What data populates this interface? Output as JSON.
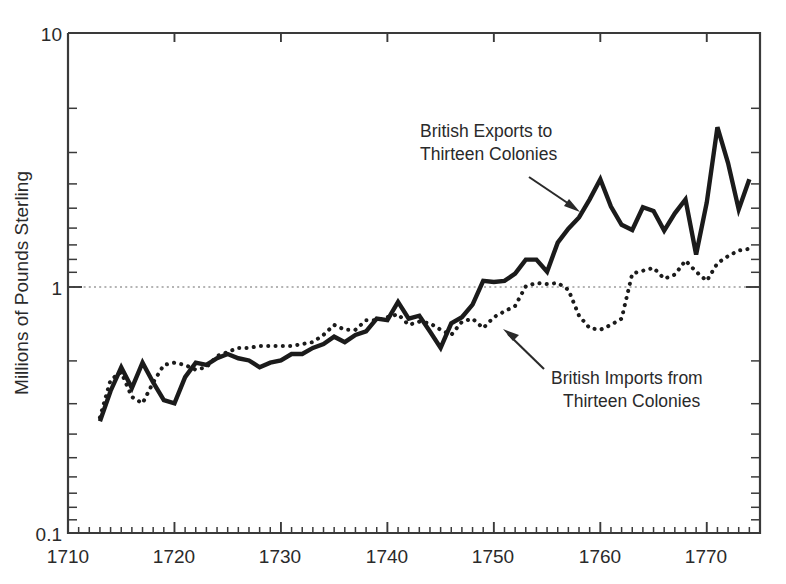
{
  "chart_data": {
    "type": "line",
    "title": "",
    "subtitle": "",
    "xlabel": "",
    "ylabel": "Millions of Pounds Sterling",
    "yscale": "log",
    "xlim": [
      1710,
      1775
    ],
    "ylim": [
      0.1,
      10
    ],
    "grid": "single dotted horizontal gridline at y = 1",
    "legend_position": "inline annotations with arrows",
    "x_tick_labels": [
      "1710",
      "1720",
      "1730",
      "1740",
      "1750",
      "1760",
      "1770"
    ],
    "x_major_ticks": [
      1710,
      1720,
      1730,
      1740,
      1750,
      1760,
      1770
    ],
    "x_minor_tick_interval": 1,
    "y_tick_labels": [
      "10",
      "1",
      "0.1"
    ],
    "y_major_ticks": [
      10,
      1,
      0.1
    ],
    "y_minor_ticks": [
      0.2,
      0.3,
      0.4,
      0.5,
      0.6,
      0.7,
      0.8,
      0.9,
      2,
      3,
      4,
      5,
      6,
      7,
      8,
      9
    ],
    "annotations": [
      {
        "text_line1": "British Exports to",
        "text_line2": "Thirteen Colonies",
        "points_to_year": 1758,
        "points_to_value": 1.75
      },
      {
        "text_line1": "British Imports from",
        "text_line2": "Thirteen Colonies",
        "points_to_year": 1752,
        "points_to_value": 0.73
      }
    ],
    "x": [
      1713,
      1714,
      1715,
      1716,
      1717,
      1718,
      1719,
      1720,
      1721,
      1722,
      1723,
      1724,
      1725,
      1726,
      1727,
      1728,
      1729,
      1730,
      1731,
      1732,
      1733,
      1734,
      1735,
      1736,
      1737,
      1738,
      1739,
      1740,
      1741,
      1742,
      1743,
      1744,
      1745,
      1746,
      1747,
      1748,
      1749,
      1750,
      1751,
      1752,
      1753,
      1754,
      1755,
      1756,
      1757,
      1758,
      1759,
      1760,
      1761,
      1762,
      1763,
      1764,
      1765,
      1766,
      1767,
      1768,
      1769,
      1770,
      1771,
      1772,
      1773,
      1774
    ],
    "series": [
      {
        "name": "British Exports to Thirteen Colonies",
        "style": "solid",
        "color": "#1b1b1b",
        "values": [
          0.28,
          0.37,
          0.46,
          0.38,
          0.48,
          0.4,
          0.34,
          0.33,
          0.42,
          0.48,
          0.47,
          0.5,
          0.52,
          0.5,
          0.49,
          0.46,
          0.48,
          0.49,
          0.52,
          0.52,
          0.55,
          0.57,
          0.61,
          0.58,
          0.62,
          0.64,
          0.72,
          0.71,
          0.84,
          0.72,
          0.74,
          0.64,
          0.55,
          0.69,
          0.73,
          0.82,
          1.02,
          1.01,
          1.02,
          1.09,
          1.24,
          1.24,
          1.11,
          1.45,
          1.65,
          1.83,
          2.16,
          2.6,
          2.02,
          1.71,
          1.63,
          2.01,
          1.94,
          1.62,
          1.9,
          2.16,
          1.3,
          2.1,
          4.2,
          3.02,
          1.97,
          2.6
        ]
      },
      {
        "name": "British Imports from Thirteen Colonies",
        "style": "dotted",
        "color": "#1b1b1b",
        "values": [
          0.29,
          0.41,
          0.44,
          0.35,
          0.33,
          0.4,
          0.47,
          0.48,
          0.47,
          0.45,
          0.46,
          0.51,
          0.53,
          0.55,
          0.55,
          0.56,
          0.56,
          0.56,
          0.56,
          0.57,
          0.58,
          0.62,
          0.68,
          0.65,
          0.65,
          0.71,
          0.71,
          0.73,
          0.75,
          0.68,
          0.7,
          0.69,
          0.65,
          0.62,
          0.7,
          0.72,
          0.66,
          0.73,
          0.77,
          0.81,
          0.97,
          1.0,
          0.99,
          1.0,
          0.94,
          0.74,
          0.66,
          0.65,
          0.68,
          0.72,
          1.09,
          1.12,
          1.15,
          1.04,
          1.08,
          1.23,
          1.11,
          1.02,
          1.2,
          1.28,
          1.35,
          1.37
        ]
      }
    ]
  }
}
